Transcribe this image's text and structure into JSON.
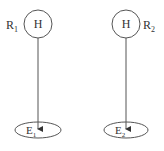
{
  "diagram": {
    "left": {
      "region_label": "R",
      "region_sub": "1",
      "node_label": "H",
      "target_label": "E",
      "target_sub": "1"
    },
    "right": {
      "region_label": "R",
      "region_sub": "2",
      "node_label": "H",
      "target_label": "E",
      "target_sub": "2"
    },
    "colors": {
      "stroke": "#555555",
      "text": "#333333",
      "background": "#ffffff"
    }
  }
}
